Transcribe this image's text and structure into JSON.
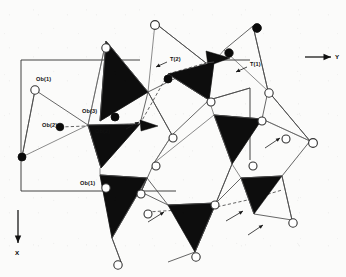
{
  "figure": {
    "kind": "crystal-structure-projection",
    "background_color": "#fbfbfa",
    "tetrahedron_fill": "#0d0d0d",
    "bond_color": "#4a4a4a",
    "cell_color": "#2e2e2e",
    "atom_open_fill": "#ffffff",
    "atom_filled_fill": "#0a0a0a"
  },
  "axes": [
    {
      "id": "axis-y",
      "label": "Y",
      "direction": "right",
      "line": {
        "x1": 305,
        "y1": 57,
        "x2": 331,
        "y2": 57
      },
      "label_pos": {
        "x": 335,
        "y": 59
      }
    },
    {
      "id": "axis-x",
      "label": "X",
      "direction": "down",
      "line": {
        "x1": 18,
        "y1": 210,
        "x2": 18,
        "y2": 243
      },
      "label_pos": {
        "x": 15,
        "y": 255
      }
    }
  ],
  "unit_cell": {
    "label": "unit-cell-outline",
    "segments": [
      {
        "x1": 21,
        "y1": 60,
        "x2": 140,
        "y2": 60
      },
      {
        "x1": 21,
        "y1": 60,
        "x2": 21,
        "y2": 191
      },
      {
        "x1": 21,
        "y1": 191,
        "x2": 107,
        "y2": 191
      },
      {
        "x1": 119,
        "y1": 191,
        "x2": 176,
        "y2": 191
      },
      {
        "x1": 250,
        "y1": 88,
        "x2": 250,
        "y2": 160
      },
      {
        "x1": 213,
        "y1": 60,
        "x2": 250,
        "y2": 60
      }
    ]
  },
  "atom_labels": [
    {
      "id": "label-ob1-left",
      "text": "Ob(1)",
      "x": 36,
      "y": 81,
      "anchor": "start"
    },
    {
      "id": "label-ob2-left",
      "text": "Ob(2)",
      "x": 42,
      "y": 127,
      "anchor": "start"
    },
    {
      "id": "label-ob3",
      "text": "Ob(3)",
      "x": 82,
      "y": 113,
      "anchor": "start"
    },
    {
      "id": "label-ob2-right",
      "text": "Ob(2)",
      "x": 95,
      "y": 133,
      "anchor": "start"
    },
    {
      "id": "label-ob1-lower",
      "text": "Ob(1)",
      "x": 80,
      "y": 185,
      "anchor": "start"
    },
    {
      "id": "label-t2",
      "text": "T(2)",
      "x": 170,
      "y": 61,
      "anchor": "start"
    },
    {
      "id": "label-t1",
      "text": "T(1)",
      "x": 250,
      "y": 66,
      "anchor": "start"
    }
  ],
  "label_pointers": [
    {
      "id": "pointer-t2",
      "x1": 167,
      "y1": 62,
      "x2": 156,
      "y2": 67
    },
    {
      "id": "pointer-t1",
      "x1": 247,
      "y1": 67,
      "x2": 236,
      "y2": 72
    },
    {
      "id": "pointer-ob2-right",
      "x1": 126,
      "y1": 129,
      "x2": 139,
      "y2": 122
    },
    {
      "id": "pointer-free-right-upper",
      "x1": 265,
      "y1": 148,
      "x2": 280,
      "y2": 138
    },
    {
      "id": "pointer-free-lower-a",
      "x1": 148,
      "y1": 222,
      "x2": 164,
      "y2": 212
    },
    {
      "id": "pointer-free-lower-b",
      "x1": 226,
      "y1": 221,
      "x2": 243,
      "y2": 211
    },
    {
      "id": "pointer-free-lower-c",
      "x1": 248,
      "y1": 235,
      "x2": 263,
      "y2": 225
    }
  ],
  "tetrahedra": [
    {
      "id": "tetra-upper-left",
      "points": "106,41 148,92 100,121"
    },
    {
      "id": "tetra-upper-center",
      "points": "168,74 214,62 209,100"
    },
    {
      "id": "tetra-mid-left",
      "points": "88,125 140,124 101,168"
    },
    {
      "id": "tetra-lower-left",
      "points": "100,175 147,178 112,238"
    },
    {
      "id": "tetra-lower-center",
      "points": "168,205 216,203 195,252"
    },
    {
      "id": "tetra-right-upper",
      "points": "214,115 262,119 232,164"
    },
    {
      "id": "tetra-right-lower",
      "points": "241,178 282,176 254,214"
    },
    {
      "id": "tetra-small-top",
      "points": "206,51 230,58 208,66"
    },
    {
      "id": "tetra-small-mid",
      "points": "140,120 158,126 141,131"
    }
  ],
  "bonds": [
    {
      "id": "b-1",
      "x1": 106,
      "y1": 41,
      "x2": 148,
      "y2": 92
    },
    {
      "id": "b-2",
      "x1": 148,
      "y1": 92,
      "x2": 100,
      "y2": 121
    },
    {
      "id": "b-3",
      "x1": 100,
      "y1": 121,
      "x2": 106,
      "y2": 41
    },
    {
      "id": "b-4",
      "x1": 155,
      "y1": 23,
      "x2": 148,
      "y2": 92
    },
    {
      "id": "b-5",
      "x1": 155,
      "y1": 23,
      "x2": 206,
      "y2": 63
    },
    {
      "id": "b-6",
      "x1": 148,
      "y1": 92,
      "x2": 206,
      "y2": 63
    },
    {
      "id": "b-7",
      "x1": 206,
      "y1": 63,
      "x2": 214,
      "y2": 62
    },
    {
      "id": "b-8",
      "x1": 214,
      "y1": 62,
      "x2": 209,
      "y2": 100
    },
    {
      "id": "b-9",
      "x1": 168,
      "y1": 74,
      "x2": 209,
      "y2": 100
    },
    {
      "id": "b-10",
      "x1": 209,
      "y1": 100,
      "x2": 214,
      "y2": 115
    },
    {
      "id": "b-11",
      "x1": 214,
      "y1": 115,
      "x2": 262,
      "y2": 119
    },
    {
      "id": "b-12",
      "x1": 262,
      "y1": 119,
      "x2": 232,
      "y2": 164
    },
    {
      "id": "b-13",
      "x1": 232,
      "y1": 164,
      "x2": 214,
      "y2": 115
    },
    {
      "id": "b-14",
      "x1": 253,
      "y1": 26,
      "x2": 224,
      "y2": 50
    },
    {
      "id": "b-15",
      "x1": 253,
      "y1": 26,
      "x2": 268,
      "y2": 91
    },
    {
      "id": "b-16",
      "x1": 224,
      "y1": 50,
      "x2": 268,
      "y2": 91
    },
    {
      "id": "b-17",
      "x1": 268,
      "y1": 91,
      "x2": 310,
      "y2": 141
    },
    {
      "id": "b-18",
      "x1": 268,
      "y1": 91,
      "x2": 262,
      "y2": 119
    },
    {
      "id": "b-19",
      "x1": 262,
      "y1": 119,
      "x2": 310,
      "y2": 141
    },
    {
      "id": "b-20",
      "x1": 310,
      "y1": 141,
      "x2": 282,
      "y2": 176
    },
    {
      "id": "b-21",
      "x1": 282,
      "y1": 176,
      "x2": 241,
      "y2": 178
    },
    {
      "id": "b-22",
      "x1": 241,
      "y1": 178,
      "x2": 232,
      "y2": 164
    },
    {
      "id": "b-23",
      "x1": 282,
      "y1": 176,
      "x2": 292,
      "y2": 220
    },
    {
      "id": "b-24",
      "x1": 254,
      "y1": 214,
      "x2": 292,
      "y2": 220
    },
    {
      "id": "b-25",
      "x1": 254,
      "y1": 214,
      "x2": 241,
      "y2": 178
    },
    {
      "id": "b-26",
      "x1": 216,
      "y1": 203,
      "x2": 241,
      "y2": 178
    },
    {
      "id": "b-27",
      "x1": 216,
      "y1": 203,
      "x2": 195,
      "y2": 252
    },
    {
      "id": "b-28",
      "x1": 195,
      "y1": 252,
      "x2": 168,
      "y2": 205
    },
    {
      "id": "b-29",
      "x1": 168,
      "y1": 205,
      "x2": 216,
      "y2": 203
    },
    {
      "id": "b-30",
      "x1": 147,
      "y1": 178,
      "x2": 168,
      "y2": 205
    },
    {
      "id": "b-31",
      "x1": 112,
      "y1": 238,
      "x2": 147,
      "y2": 178
    },
    {
      "id": "b-32",
      "x1": 112,
      "y1": 238,
      "x2": 100,
      "y2": 175
    },
    {
      "id": "b-33",
      "x1": 100,
      "y1": 175,
      "x2": 147,
      "y2": 178
    },
    {
      "id": "b-34",
      "x1": 100,
      "y1": 168,
      "x2": 100,
      "y2": 175
    },
    {
      "id": "b-35",
      "x1": 88,
      "y1": 125,
      "x2": 101,
      "y2": 168
    },
    {
      "id": "b-36",
      "x1": 101,
      "y1": 168,
      "x2": 140,
      "y2": 124
    },
    {
      "id": "b-37",
      "x1": 88,
      "y1": 125,
      "x2": 140,
      "y2": 124
    },
    {
      "id": "b-38",
      "x1": 35,
      "y1": 90,
      "x2": 88,
      "y2": 125
    },
    {
      "id": "b-39",
      "x1": 35,
      "y1": 90,
      "x2": 22,
      "y2": 157
    },
    {
      "id": "b-40",
      "x1": 22,
      "y1": 157,
      "x2": 88,
      "y2": 125
    },
    {
      "id": "b-41",
      "x1": 148,
      "y1": 92,
      "x2": 172,
      "y2": 135
    },
    {
      "id": "b-42",
      "x1": 172,
      "y1": 135,
      "x2": 209,
      "y2": 100
    },
    {
      "id": "b-43",
      "x1": 172,
      "y1": 135,
      "x2": 154,
      "y2": 163
    },
    {
      "id": "b-44",
      "x1": 154,
      "y1": 163,
      "x2": 141,
      "y2": 192
    },
    {
      "id": "b-45",
      "x1": 141,
      "y1": 192,
      "x2": 147,
      "y2": 178
    },
    {
      "id": "b-46",
      "x1": 154,
      "y1": 163,
      "x2": 214,
      "y2": 115
    },
    {
      "id": "b-47",
      "x1": 232,
      "y1": 164,
      "x2": 216,
      "y2": 203
    },
    {
      "id": "b-48",
      "x1": 140,
      "y1": 124,
      "x2": 148,
      "y2": 92
    },
    {
      "id": "b-49",
      "x1": 106,
      "y1": 41,
      "x2": 88,
      "y2": 125
    },
    {
      "id": "b-50",
      "x1": 195,
      "y1": 252,
      "x2": 168,
      "y2": 262
    },
    {
      "id": "b-51",
      "x1": 112,
      "y1": 238,
      "x2": 121,
      "y2": 262
    },
    {
      "id": "b-52",
      "x1": 214,
      "y1": 62,
      "x2": 224,
      "y2": 50
    },
    {
      "id": "b-53",
      "x1": 209,
      "y1": 100,
      "x2": 250,
      "y2": 88
    },
    {
      "id": "b-54",
      "x1": 168,
      "y1": 205,
      "x2": 141,
      "y2": 192
    }
  ],
  "dashed_bonds": [
    {
      "id": "d-1",
      "x1": 60,
      "y1": 127,
      "x2": 140,
      "y2": 124
    },
    {
      "id": "d-2",
      "x1": 140,
      "y1": 124,
      "x2": 168,
      "y2": 74
    },
    {
      "id": "d-3",
      "x1": 168,
      "y1": 74,
      "x2": 206,
      "y2": 63
    },
    {
      "id": "d-4",
      "x1": 147,
      "y1": 212,
      "x2": 212,
      "y2": 208
    },
    {
      "id": "d-5",
      "x1": 212,
      "y1": 208,
      "x2": 252,
      "y2": 199
    },
    {
      "id": "d-6",
      "x1": 252,
      "y1": 199,
      "x2": 282,
      "y2": 190
    }
  ],
  "atoms": [
    {
      "id": "a-01",
      "type": "open",
      "label": "Ob(1)",
      "x": 35,
      "y": 90,
      "r": 4.2
    },
    {
      "id": "a-02",
      "type": "filled",
      "label": "Ob(2)",
      "x": 60,
      "y": 127,
      "r": 3.8
    },
    {
      "id": "a-03",
      "type": "filled",
      "label": "Ob",
      "x": 22,
      "y": 157,
      "r": 4.0
    },
    {
      "id": "a-04",
      "type": "filled",
      "label": "Ob(3)",
      "x": 115,
      "y": 117,
      "r": 4.0
    },
    {
      "id": "a-05",
      "type": "open",
      "label": "Ob(1)",
      "x": 106,
      "y": 188,
      "r": 4.2
    },
    {
      "id": "a-06",
      "type": "open",
      "label": "O",
      "x": 106,
      "y": 48,
      "r": 4.2
    },
    {
      "id": "a-07",
      "type": "open",
      "label": "O",
      "x": 155,
      "y": 25,
      "r": 4.4
    },
    {
      "id": "a-08",
      "type": "filled",
      "label": "T(2)",
      "x": 168,
      "y": 79,
      "r": 4.0
    },
    {
      "id": "a-09",
      "type": "filled",
      "label": "T",
      "x": 229,
      "y": 53,
      "r": 4.2
    },
    {
      "id": "a-10",
      "type": "filled",
      "label": "T(1)",
      "x": 257,
      "y": 28,
      "r": 4.4
    },
    {
      "id": "a-11",
      "type": "open",
      "label": "O",
      "x": 269,
      "y": 93,
      "r": 4.2
    },
    {
      "id": "a-12",
      "type": "open",
      "label": "O",
      "x": 313,
      "y": 143,
      "r": 4.4
    },
    {
      "id": "a-13",
      "type": "open",
      "label": "O",
      "x": 286,
      "y": 139,
      "r": 4.0
    },
    {
      "id": "a-14",
      "type": "open",
      "label": "O",
      "x": 262,
      "y": 121,
      "r": 4.0
    },
    {
      "id": "a-15",
      "type": "open",
      "label": "O",
      "x": 253,
      "y": 166,
      "r": 4.0
    },
    {
      "id": "a-16",
      "type": "open",
      "label": "O",
      "x": 293,
      "y": 223,
      "r": 4.2
    },
    {
      "id": "a-17",
      "type": "open",
      "label": "O",
      "x": 215,
      "y": 205,
      "r": 4.0
    },
    {
      "id": "a-18",
      "type": "open",
      "label": "O",
      "x": 196,
      "y": 257,
      "r": 4.2
    },
    {
      "id": "a-19",
      "type": "open",
      "label": "O",
      "x": 118,
      "y": 265,
      "r": 4.2
    },
    {
      "id": "a-20",
      "type": "open",
      "label": "O",
      "x": 148,
      "y": 214,
      "r": 4.0
    },
    {
      "id": "a-21",
      "type": "open",
      "label": "O",
      "x": 156,
      "y": 166,
      "r": 4.0
    },
    {
      "id": "a-22",
      "type": "open",
      "label": "O",
      "x": 173,
      "y": 138,
      "r": 4.0
    },
    {
      "id": "a-23",
      "type": "open",
      "label": "O",
      "x": 211,
      "y": 102,
      "r": 4.0
    },
    {
      "id": "a-24",
      "type": "open",
      "label": "O",
      "x": 141,
      "y": 194,
      "r": 4.0
    }
  ]
}
